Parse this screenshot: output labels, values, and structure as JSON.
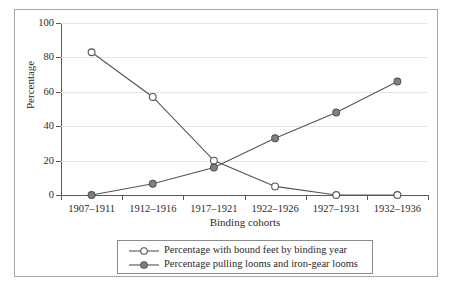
{
  "chart_data": {
    "type": "line",
    "title": "",
    "xlabel": "Binding cohorts",
    "ylabel": "Percentage",
    "categories": [
      "1907–1911",
      "1912–1916",
      "1917–1921",
      "1922–1926",
      "1927–1931",
      "1932–1936"
    ],
    "ylim": [
      0,
      100
    ],
    "yticks": [
      0,
      20,
      40,
      60,
      80,
      100
    ],
    "ytick_labels": [
      "0",
      "20",
      "40",
      "60",
      "80",
      "100"
    ],
    "grid": true,
    "grid_axis": "y",
    "legend_position": "below-axes",
    "series": [
      {
        "name": "Percentage with bound feet by binding year",
        "marker": "open-circle",
        "color": "#555555",
        "fill": "#ffffff",
        "values": [
          83,
          57,
          20,
          5,
          0,
          0
        ]
      },
      {
        "name": "Percentage pulling looms and iron-gear looms",
        "marker": "filled-circle",
        "color": "#555555",
        "fill": "#808080",
        "values": [
          0,
          6.5,
          16,
          33,
          48,
          66
        ]
      }
    ]
  },
  "legend": {
    "items": [
      {
        "label": "Percentage with bound feet by binding year",
        "marker": "open-circle"
      },
      {
        "label": "Percentage pulling looms and iron-gear looms",
        "marker": "filled-circle"
      }
    ]
  },
  "colors": {
    "frame": "#a8a8a8",
    "axis": "#5a5a5a",
    "grid": "#e6e6e6",
    "line": "#555555",
    "marker_fill_open": "#ffffff",
    "marker_fill_solid": "#808080",
    "text": "#2b2b2b"
  }
}
